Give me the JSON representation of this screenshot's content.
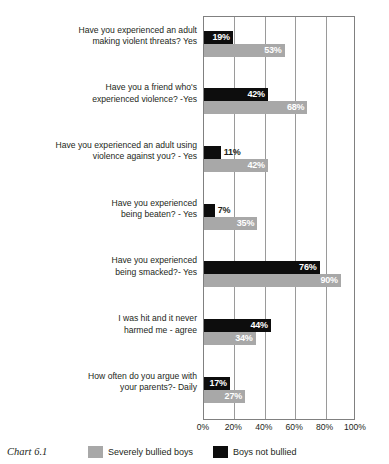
{
  "caption": "Chart 6.1",
  "colors": {
    "dark_bar": "#0d0d0d",
    "light_bar": "#a8a8a8",
    "gridline": "#9a9a9a",
    "frame": "#808080",
    "text": "#231f20",
    "background": "#ffffff"
  },
  "legend": {
    "entries": [
      {
        "label": "Severely bullied boys",
        "color": "#a8a8a8",
        "swatch": "light-swatch"
      },
      {
        "label": "Boys not bullied",
        "color": "#0d0d0d",
        "swatch": "dark-swatch"
      }
    ]
  },
  "chart_data": {
    "type": "bar",
    "orientation": "horizontal",
    "title": "Chart 6.1",
    "xlabel": "",
    "ylabel": "",
    "xlim": [
      0,
      100
    ],
    "xticks": [
      0,
      20,
      40,
      60,
      80,
      100
    ],
    "xtick_labels": [
      "0%",
      "20%",
      "40%",
      "60%",
      "80%",
      "100%"
    ],
    "grid": true,
    "legend_position": "bottom",
    "value_suffix": "%",
    "categories": [
      "Have you experienced an adult making violent threats? Yes",
      "Have you a friend who's experienced violence? -Yes",
      "Have you experienced an adult using violence against you? - Yes",
      "Have you experienced being beaten? - Yes",
      "Have you experienced being smacked?- Yes",
      "I was hit and it never harmed me - agree",
      "How often do you argue with your parents?- Daily"
    ],
    "category_lines": [
      [
        "Have you experienced an adult",
        "making violent threats? Yes"
      ],
      [
        "Have you a friend who's",
        "experienced violence? -Yes"
      ],
      [
        "Have you experienced an adult using",
        "violence against you? - Yes"
      ],
      [
        "Have you experienced",
        "being beaten? - Yes"
      ],
      [
        "Have you experienced",
        "being smacked?- Yes"
      ],
      [
        "I was hit and it never",
        "harmed me - agree"
      ],
      [
        "How often do you argue with",
        "your parents?- Daily"
      ]
    ],
    "series": [
      {
        "name": "Boys not bullied",
        "color": "#0d0d0d",
        "values": [
          19,
          42,
          11,
          7,
          76,
          44,
          17
        ],
        "labels": [
          "19%",
          "42%",
          "11%",
          "7%",
          "76%",
          "44%",
          "17%"
        ],
        "label_placement": [
          "inside",
          "inside",
          "outside",
          "outside",
          "inside",
          "inside",
          "inside"
        ]
      },
      {
        "name": "Severely bullied boys",
        "color": "#a8a8a8",
        "values": [
          53,
          68,
          42,
          35,
          90,
          34,
          27
        ],
        "labels": [
          "53%",
          "68%",
          "42%",
          "35%",
          "90%",
          "34%",
          "27%"
        ],
        "label_placement": [
          "inside",
          "inside",
          "inside",
          "inside",
          "inside",
          "inside",
          "inside"
        ]
      }
    ]
  }
}
